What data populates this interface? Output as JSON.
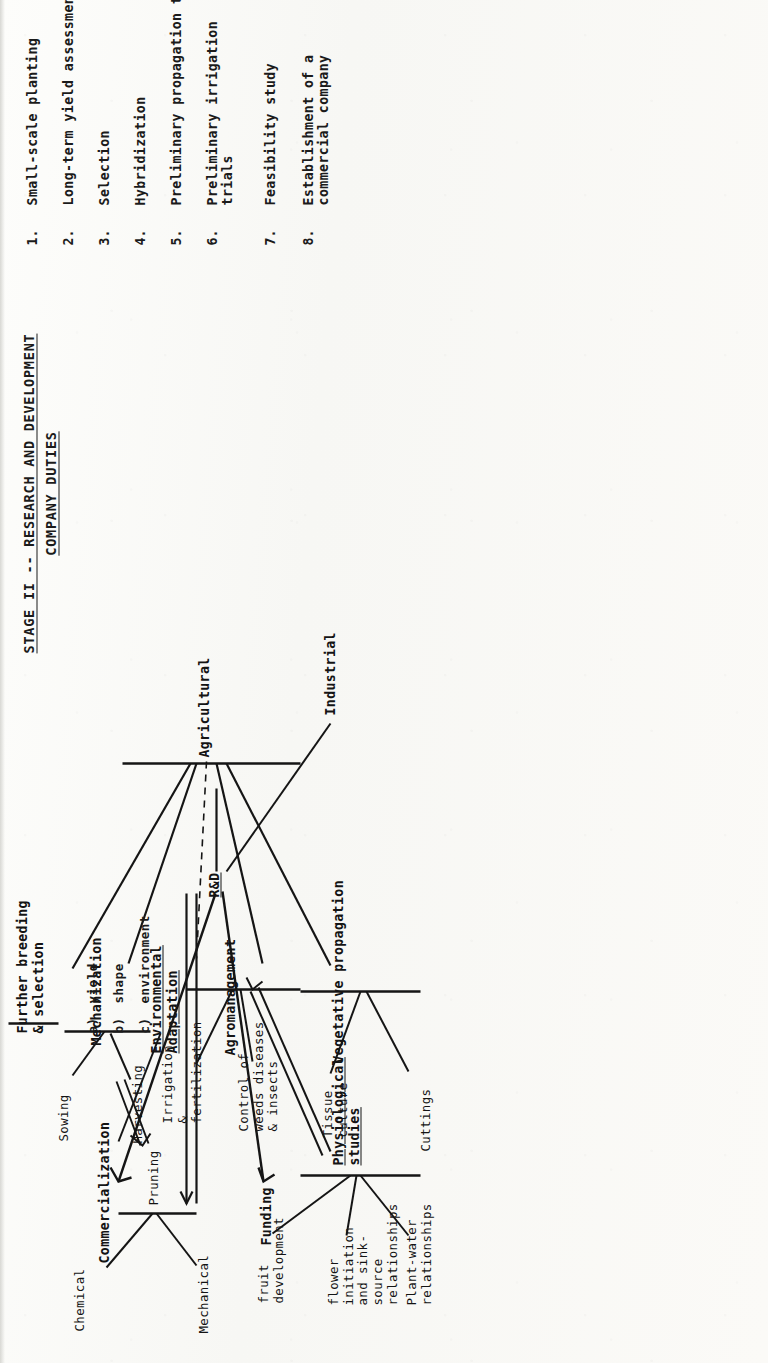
{
  "page": {
    "title_line1": "STAGE II -- RESEARCH AND DEVELOPMENT",
    "title_line2": "COMPANY DUTIES",
    "orientation": "rotated-90-ccw",
    "ink_color": "#151515",
    "paper_color": "#fbfbf9"
  },
  "diagram": {
    "root": "R&D",
    "flows": {
      "funding": "Funding",
      "commercialization": "Commercialization"
    },
    "branches": {
      "industrial": "Industrial",
      "agricultural": "Agricultural"
    },
    "agricultural_children": [
      "Vegetative propagation",
      "Agromanagement",
      "Environmental\nAdaptation",
      "Mechanization",
      "Further breeding\n& selection"
    ],
    "vegetative_propagation": [
      "Cuttings",
      "Tissue\nculture"
    ],
    "agromanagement": [
      "Control of\nweeds diseases\n& insects",
      "Irrigation\n&\nfertilization"
    ],
    "physiological_studies": {
      "label": "Physiological\nstudies",
      "items": [
        "Plant-water\nrelationships",
        "flower\ninitiation\nand sink-\nsource\nrelationships",
        "fruit\ndevelopment"
      ]
    },
    "mechanization": [
      "Harvesting",
      "Sowing"
    ],
    "pruning": {
      "label": "Pruning",
      "items": [
        "Mechanical",
        "Chemical"
      ]
    },
    "further_breeding_criteria": [
      {
        "key": "a)",
        "label": "yield"
      },
      {
        "key": "b)",
        "label": "shape"
      },
      {
        "key": "c)",
        "label": "environment"
      }
    ]
  },
  "checklist": {
    "items": [
      {
        "num": "1.",
        "label": "Small-scale planting"
      },
      {
        "num": "2.",
        "label": "Long-term yield assessment"
      },
      {
        "num": "3.",
        "label": "Selection"
      },
      {
        "num": "4.",
        "label": "Hybridization"
      },
      {
        "num": "5.",
        "label": "Preliminary propagation trials"
      },
      {
        "num": "6.",
        "label": "Preliminary irrigation\ntrials"
      },
      {
        "num": "7.",
        "label": "Feasibility study"
      },
      {
        "num": "8.",
        "label": "Establishment of a\ncommercial company"
      }
    ]
  }
}
